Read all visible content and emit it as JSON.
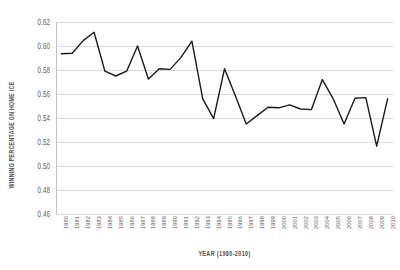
{
  "chart_data": {
    "type": "line",
    "title": "",
    "xlabel": "YEAR (1980-2010)",
    "ylabel": "WINNING PERCENTAGE ON HOME ICE",
    "ylim": [
      0.46,
      0.62
    ],
    "ytick_step": 0.02,
    "yticks": [
      "0.62",
      "0.60",
      "0.58",
      "0.56",
      "0.54",
      "0.52",
      "0.50",
      "0.48",
      "0.46"
    ],
    "ytick_values": [
      0.62,
      0.6,
      0.58,
      0.56,
      0.54,
      0.52,
      0.5,
      0.48,
      0.46
    ],
    "grid": true,
    "legend": "none",
    "line_color": "#1a1a1a",
    "grid_color": "#d9d9d9",
    "categories": [
      "1980",
      "1981",
      "1982",
      "1983",
      "1984",
      "1985",
      "1986",
      "1987",
      "1988",
      "1989",
      "1990",
      "1991",
      "1992",
      "1993",
      "1994",
      "1995",
      "1996",
      "1997",
      "1998",
      "1999",
      "2000",
      "2001",
      "2002",
      "2003",
      "2004",
      "2005",
      "2006",
      "2007",
      "2008",
      "2009",
      "2010"
    ],
    "values": [
      0.5935,
      0.594,
      0.6045,
      0.6115,
      0.579,
      0.575,
      0.579,
      0.6,
      0.5725,
      0.581,
      0.5805,
      0.5905,
      0.604,
      0.556,
      0.5395,
      0.581,
      0.5585,
      0.535,
      0.542,
      0.549,
      0.5485,
      0.551,
      0.5475,
      0.547,
      0.572,
      0.556,
      0.535,
      0.5565,
      0.557,
      0.5165,
      0.556
    ],
    "series_name": "Winning percentage on home ice"
  }
}
